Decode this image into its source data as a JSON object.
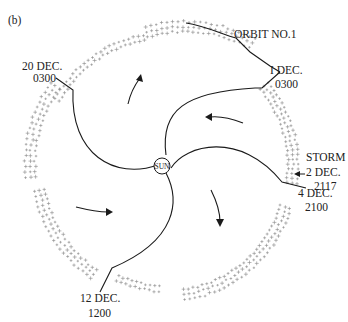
{
  "figure": {
    "panel_label": "(b)",
    "center_label": "SUN",
    "orbit_label": "ORBIT NO.1",
    "boundaries": [
      {
        "id": "b1",
        "date_line1": "I DEC.",
        "date_line2": "0300"
      },
      {
        "id": "b2",
        "date_line1": "4 DEC.",
        "date_line2": "2100"
      },
      {
        "id": "b3",
        "date_line1": "12 DEC.",
        "date_line2": "1200"
      },
      {
        "id": "b4",
        "date_line1": "20 DEC.",
        "date_line2": "0300"
      }
    ],
    "event": {
      "line1": "STORM",
      "line2": "2 DEC.",
      "line3": "2117"
    },
    "sector_arrows": [
      "outward-rotation",
      "inward",
      "outward",
      "inward"
    ],
    "colors": {
      "lines": "#1a1a1a",
      "data_points": "#888888",
      "background": "#ffffff"
    }
  }
}
